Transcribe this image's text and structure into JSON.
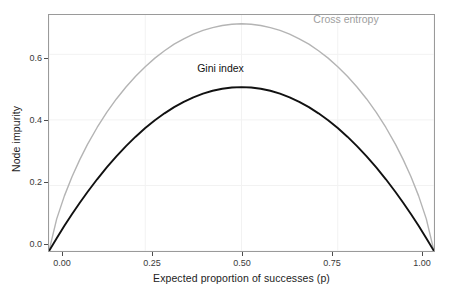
{
  "chart_data": {
    "type": "line",
    "title": "",
    "subtitle": "",
    "xlabel": "Expected proportion of successes (p)",
    "ylabel": "Node impurity",
    "xlim": [
      0,
      1
    ],
    "ylim": [
      0,
      0.72
    ],
    "xticks": [
      "0.00",
      "0.25",
      "0.50",
      "0.75",
      "1.00"
    ],
    "xtick_values": [
      0,
      0.25,
      0.5,
      0.75,
      1
    ],
    "yticks": [
      "0.0",
      "0.2",
      "0.4",
      "0.6"
    ],
    "ytick_values": [
      0,
      0.2,
      0.4,
      0.6
    ],
    "grid": true,
    "legend_position": "inline-annotations",
    "series": [
      {
        "name": "Cross entropy",
        "color": "#b4b4b4",
        "formula": "-p*log(p) - (1-p)*log(1-p)",
        "peak": {
          "x": 0.5,
          "y": 0.693
        },
        "x": [
          0,
          0.02,
          0.04,
          0.06,
          0.08,
          0.1,
          0.125,
          0.15,
          0.175,
          0.2,
          0.225,
          0.25,
          0.275,
          0.3,
          0.325,
          0.35,
          0.375,
          0.4,
          0.425,
          0.45,
          0.475,
          0.5,
          0.525,
          0.55,
          0.575,
          0.6,
          0.625,
          0.65,
          0.675,
          0.7,
          0.725,
          0.75,
          0.775,
          0.8,
          0.825,
          0.85,
          0.875,
          0.9,
          0.92,
          0.94,
          0.96,
          0.98,
          1
        ],
        "y": [
          0,
          0.098,
          0.1682,
          0.2272,
          0.2787,
          0.3251,
          0.3768,
          0.4227,
          0.4639,
          0.5004,
          0.5329,
          0.5623,
          0.5884,
          0.6109,
          0.6313,
          0.6474,
          0.6616,
          0.673,
          0.6813,
          0.6881,
          0.6919,
          0.6931,
          0.6919,
          0.6881,
          0.6813,
          0.673,
          0.6616,
          0.6474,
          0.6313,
          0.6109,
          0.5884,
          0.5623,
          0.5329,
          0.5004,
          0.4639,
          0.4227,
          0.3768,
          0.3251,
          0.2787,
          0.2272,
          0.1682,
          0.098,
          0
        ]
      },
      {
        "name": "Gini index",
        "color": "#111111",
        "formula": "2*p*(1-p)",
        "peak": {
          "x": 0.5,
          "y": 0.5
        },
        "x": [
          0,
          0.02,
          0.04,
          0.06,
          0.08,
          0.1,
          0.125,
          0.15,
          0.175,
          0.2,
          0.225,
          0.25,
          0.275,
          0.3,
          0.325,
          0.35,
          0.375,
          0.4,
          0.425,
          0.45,
          0.475,
          0.5,
          0.525,
          0.55,
          0.575,
          0.6,
          0.625,
          0.65,
          0.675,
          0.7,
          0.725,
          0.75,
          0.775,
          0.8,
          0.825,
          0.85,
          0.875,
          0.9,
          0.92,
          0.94,
          0.96,
          0.98,
          1
        ],
        "y": [
          0,
          0.0392,
          0.0768,
          0.1128,
          0.1472,
          0.18,
          0.2188,
          0.255,
          0.2888,
          0.32,
          0.3488,
          0.375,
          0.3988,
          0.42,
          0.4388,
          0.455,
          0.4688,
          0.48,
          0.4888,
          0.495,
          0.4988,
          0.5,
          0.4988,
          0.495,
          0.4888,
          0.48,
          0.4688,
          0.455,
          0.4388,
          0.42,
          0.3988,
          0.375,
          0.3488,
          0.32,
          0.2888,
          0.255,
          0.2188,
          0.18,
          0.1472,
          0.1128,
          0.0768,
          0.0392,
          0
        ]
      }
    ],
    "annotations": [
      {
        "text": "Cross entropy",
        "x": 0.78,
        "y": 0.705,
        "color": "#9e9e9e"
      },
      {
        "text": "Gini index",
        "x": 0.455,
        "y": 0.555,
        "color": "#111111"
      }
    ]
  },
  "axes": {
    "y_title": "Node impurity",
    "x_title": "Expected proportion of successes (p)"
  },
  "ticks": {
    "y": [
      {
        "label": "0.6"
      },
      {
        "label": "0.4"
      },
      {
        "label": "0.2"
      },
      {
        "label": "0.0"
      }
    ],
    "x": [
      {
        "label": "0.00"
      },
      {
        "label": "0.25"
      },
      {
        "label": "0.50"
      },
      {
        "label": "0.75"
      },
      {
        "label": "1.00"
      }
    ]
  },
  "labels": {
    "cross_entropy": "Cross entropy",
    "gini_index": "Gini index"
  },
  "colors": {
    "cross_entropy": "#b4b4b4",
    "gini_index": "#111111",
    "panel_border": "#9a9a9a",
    "grid": "#f2f2f2",
    "background": "#ffffff"
  }
}
